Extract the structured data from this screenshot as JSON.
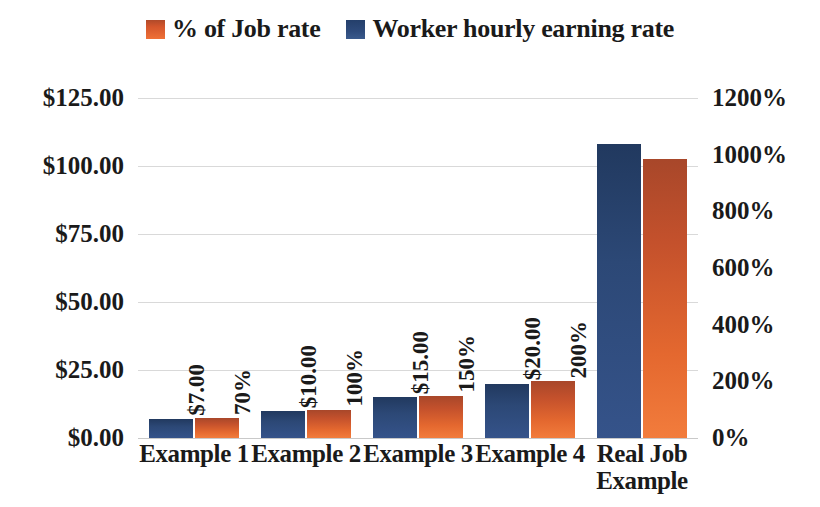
{
  "legend": {
    "items": [
      {
        "label": "% of Job rate",
        "swatch": "orange-square-icon",
        "color": "#ef7137"
      },
      {
        "label": "Worker hourly earning rate",
        "swatch": "blue-square-icon",
        "color": "#2e4b7c"
      }
    ]
  },
  "axis_left": {
    "ticks": [
      "$125.00",
      "$100.00",
      "$75.00",
      "$50.00",
      "$25.00",
      "$0.00"
    ]
  },
  "axis_right": {
    "ticks": [
      "1200%",
      "1000%",
      "800%",
      "600%",
      "400%",
      "200%",
      "0%"
    ]
  },
  "chart_data": {
    "type": "bar",
    "title": "",
    "xlabel": "",
    "ylabel": "",
    "categories": [
      "Example 1",
      "Example 2",
      "Example 3",
      "Example 4",
      "Real Job Example"
    ],
    "grid": true,
    "legend_position": "top-center",
    "series": [
      {
        "name": "Worker hourly earning rate",
        "axis": "left",
        "unit": "$",
        "color": "#2e4b7c",
        "values": [
          7.0,
          10.0,
          15.0,
          20.0,
          108.0
        ],
        "labels": [
          "$7.00",
          "$10.00",
          "$15.00",
          "$20.00",
          ""
        ],
        "ylim": [
          0,
          125
        ],
        "ytick_step": 25
      },
      {
        "name": "% of Job rate",
        "axis": "right",
        "unit": "%",
        "color": "#ef7137",
        "values": [
          70,
          100,
          150,
          200,
          985
        ],
        "labels": [
          "70%",
          "100%",
          "150%",
          "200%",
          ""
        ],
        "ylim": [
          0,
          1200
        ],
        "ytick_step": 200
      }
    ]
  },
  "categories_display": [
    {
      "line1": "Example 1",
      "line2": ""
    },
    {
      "line1": "Example 2",
      "line2": ""
    },
    {
      "line1": "Example 3",
      "line2": ""
    },
    {
      "line1": "Example 4",
      "line2": ""
    },
    {
      "line1": "Real Job",
      "line2": "Example"
    }
  ]
}
